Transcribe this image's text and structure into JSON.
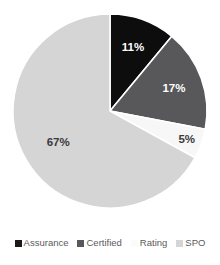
{
  "chart_data": {
    "type": "pie",
    "title": "",
    "subtitle": "",
    "xlabel": "",
    "ylabel": "",
    "grid": false,
    "legend_position": "bottom",
    "start_angle_deg": 0,
    "direction": "clockwise",
    "categories": [
      "Assurance",
      "Certified",
      "Rating",
      "SPO"
    ],
    "values": [
      11,
      17,
      5,
      67
    ],
    "value_unit": "%",
    "data_labels": [
      "11%",
      "17%",
      "5%",
      "67%"
    ],
    "colors": [
      "#0d0d0d",
      "#58585a",
      "#f7f7f7",
      "#d5d5d5"
    ],
    "label_text_colors": [
      "#ffffff",
      "#ffffff",
      "#3a3a3a",
      "#3a3a3a"
    ],
    "slices": [
      {
        "name": "Assurance",
        "value": 11,
        "label": "11%",
        "color": "#0d0d0d",
        "label_color": "#ffffff"
      },
      {
        "name": "Certified",
        "value": 17,
        "label": "17%",
        "color": "#58585a",
        "label_color": "#ffffff"
      },
      {
        "name": "Rating",
        "value": 5,
        "label": "5%",
        "color": "#f7f7f7",
        "label_color": "#3a3a3a"
      },
      {
        "name": "SPO",
        "value": 67,
        "label": "67%",
        "color": "#d5d5d5",
        "label_color": "#3a3a3a"
      }
    ]
  },
  "legend": {
    "items": [
      {
        "label": "Assurance",
        "color": "#1a1a1a"
      },
      {
        "label": "Certified",
        "color": "#58585a"
      },
      {
        "label": "Rating",
        "color": "#fbfbfb"
      },
      {
        "label": "SPO",
        "color": "#d5d5d5"
      }
    ]
  },
  "geometry": {
    "center_x": 110,
    "center_y": 111,
    "radius": 97,
    "separator_color": "#ffffff",
    "separator_width": 1.6
  }
}
